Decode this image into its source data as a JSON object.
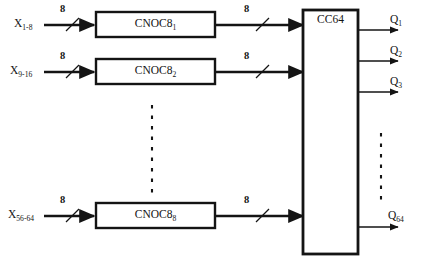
{
  "diagram": {
    "stroke_color": "#141414",
    "background": "#ffffff",
    "input_rows": [
      {
        "signal": "X",
        "signal_sub": "1-8",
        "bus_width": "8",
        "block": "CNOC8",
        "block_sub": "1",
        "out_bus_width": "8"
      },
      {
        "signal": "X",
        "signal_sub": "9-16",
        "bus_width": "8",
        "block": "CNOC8",
        "block_sub": "2",
        "out_bus_width": "8"
      },
      {
        "signal": "X",
        "signal_sub": "56-64",
        "bus_width": "8",
        "block": "CNOC8",
        "block_sub": "8",
        "out_bus_width": "8"
      }
    ],
    "combiner": {
      "label": "CC64"
    },
    "outputs": [
      {
        "name": "Q",
        "sub": "1"
      },
      {
        "name": "Q",
        "sub": "2"
      },
      {
        "name": "Q",
        "sub": "3"
      },
      {
        "name": "Q",
        "sub": "64"
      }
    ],
    "ellipses": [
      {
        "name": "blocks-column-ellipsis"
      },
      {
        "name": "outputs-column-ellipsis"
      }
    ]
  }
}
